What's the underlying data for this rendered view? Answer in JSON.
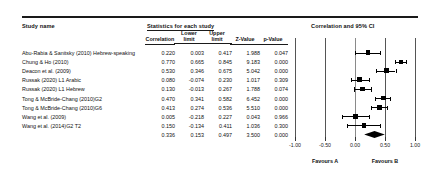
{
  "headers": {
    "study_name": "Study name",
    "statistics_group": "Statistics for each study",
    "plot_group": "Correlation and 95% CI",
    "correlation": "Correlation",
    "lower_limit_l1": "Lower",
    "lower_limit_l2": "limit",
    "upper_limit_l1": "Upper",
    "upper_limit_l2": "limit",
    "z_value": "Z-Value",
    "p_value": "p-Value"
  },
  "axis": {
    "ticks": [
      "-1.00",
      "-0.50",
      "0.00",
      "0.50",
      "1.00"
    ],
    "tick_values": [
      -1.0,
      -0.5,
      0.0,
      0.5,
      1.0
    ],
    "favours_left": "Favours A",
    "favours_right": "Favours B"
  },
  "chart_data": {
    "type": "forest",
    "title": "Correlation and 95% CI",
    "xlabel": "",
    "ylabel": "",
    "xlim": [
      -1.0,
      1.0
    ],
    "grid": false,
    "legend": "none",
    "effect_measure": "Correlation",
    "columns": [
      "Study name",
      "Correlation",
      "Lower limit",
      "Upper limit",
      "Z-Value",
      "p-Value"
    ],
    "rows": [
      {
        "study": "Abu-Rabia & Sanitsky (2010) Hebrew-speaking",
        "correlation": 0.22,
        "lower": 0.003,
        "upper": 0.417,
        "z": 1.988,
        "p": 0.047,
        "correlation_s": "0.220",
        "lower_s": "0.003",
        "upper_s": "0.417",
        "z_s": "1.988",
        "p_s": "0.047",
        "weight": 0.55
      },
      {
        "study": "Chung & Ho (2010)",
        "correlation": 0.77,
        "lower": 0.665,
        "upper": 0.845,
        "z": 9.183,
        "p": 0.0,
        "correlation_s": "0.770",
        "lower_s": "0.665",
        "upper_s": "0.845",
        "z_s": "9.183",
        "p_s": "0.000",
        "weight": 0.5
      },
      {
        "study": "Deacon et al. (2009)",
        "correlation": 0.53,
        "lower": 0.346,
        "upper": 0.675,
        "z": 5.042,
        "p": 0.0,
        "correlation_s": "0.530",
        "lower_s": "0.346",
        "upper_s": "0.675",
        "z_s": "5.042",
        "p_s": "0.000",
        "weight": 0.58
      },
      {
        "study": "Russak (2020) L1 Arabic",
        "correlation": 0.08,
        "lower": -0.074,
        "upper": 0.23,
        "z": 1.017,
        "p": 0.309,
        "correlation_s": "0.080",
        "lower_s": "-0.074",
        "upper_s": "0.230",
        "z_s": "1.017",
        "p_s": "0.309",
        "weight": 0.62
      },
      {
        "study": "Russak (2020) L1 Hebrew",
        "correlation": 0.13,
        "lower": -0.013,
        "upper": 0.267,
        "z": 1.788,
        "p": 0.074,
        "correlation_s": "0.130",
        "lower_s": "-0.013",
        "upper_s": "0.267",
        "z_s": "1.788",
        "p_s": "0.074",
        "weight": 0.62
      },
      {
        "study": "Tong & McBride-Chang (2010)G2",
        "correlation": 0.47,
        "lower": 0.341,
        "upper": 0.582,
        "z": 6.452,
        "p": 0.0,
        "correlation_s": "0.470",
        "lower_s": "0.341",
        "upper_s": "0.582",
        "z_s": "6.452",
        "p_s": "0.000",
        "weight": 0.6
      },
      {
        "study": "Tong & McBride-Chang (2010)G6",
        "correlation": 0.413,
        "lower": 0.274,
        "upper": 0.536,
        "z": 5.51,
        "p": 0.0,
        "correlation_s": "0.413",
        "lower_s": "0.274",
        "upper_s": "0.536",
        "z_s": "5.510",
        "p_s": "0.000",
        "weight": 0.6
      },
      {
        "study": "Wang et al. (2009)",
        "correlation": 0.005,
        "lower": -0.218,
        "upper": 0.227,
        "z": 0.043,
        "p": 0.966,
        "correlation_s": "0.005",
        "lower_s": "-0.218",
        "upper_s": "0.227",
        "z_s": "0.043",
        "p_s": "0.966",
        "weight": 0.68
      },
      {
        "study": "Wang et al. (2014)G2 T2",
        "correlation": 0.15,
        "lower": -0.134,
        "upper": 0.411,
        "z": 1.036,
        "p": 0.3,
        "correlation_s": "0.150",
        "lower_s": "-0.134",
        "upper_s": "0.411",
        "z_s": "1.036",
        "p_s": "0.300",
        "weight": 0.46
      },
      {
        "study": "",
        "correlation": 0.336,
        "lower": 0.153,
        "upper": 0.497,
        "z": 3.5,
        "p": 0.0,
        "correlation_s": "0.336",
        "lower_s": "0.153",
        "upper_s": "0.497",
        "z_s": "3.500",
        "p_s": "0.000",
        "weight": 0,
        "summary": true
      }
    ]
  }
}
